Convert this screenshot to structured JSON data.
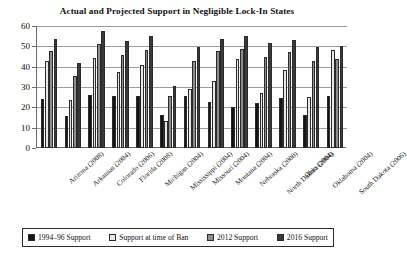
{
  "chart_data": {
    "type": "bar",
    "title": "Actual and Projected Support in Negligible Lock-In States",
    "xlabel": "",
    "ylabel": "",
    "ylim": [
      0,
      60
    ],
    "yticks": [
      0,
      10,
      20,
      30,
      40,
      50,
      60
    ],
    "grid": true,
    "legend_position": "bottom",
    "categories": [
      "Arizona (2008)",
      "Arkansas (2004)",
      "Colorado (2006)",
      "Florida (2008)",
      "Michigan (2004)",
      "Mississippi (2004)",
      "Missouri (2004)",
      "Montana (2004)",
      "Nebraska (2000)",
      "North Dakota (2004)",
      "Ohio (2004)",
      "Oklahoma (2004)",
      "South Dakota (2006)"
    ],
    "series": [
      {
        "name": "1994–96 Support",
        "color": "#141414",
        "values": [
          24,
          15.5,
          26,
          25.5,
          25.5,
          16,
          25.5,
          22.5,
          20,
          22,
          24.5,
          16,
          25.5
        ]
      },
      {
        "name": "Support at time of Ban",
        "color": "#e8e8e8",
        "values": [
          43,
          23.5,
          44.5,
          37.5,
          41,
          13.5,
          29,
          33,
          44,
          27,
          38.5,
          25,
          48
        ]
      },
      {
        "name": "2012 Support",
        "color": "#8d8d8d",
        "values": [
          47.5,
          35.5,
          51,
          45.5,
          48,
          25.5,
          43,
          47.5,
          48.5,
          45,
          47,
          43,
          44
        ]
      },
      {
        "name": "2016 Support",
        "color": "#3a3a3a",
        "values": [
          53.5,
          42,
          57.5,
          52.5,
          55,
          30.5,
          49.5,
          53.5,
          55,
          51.5,
          53,
          49.5,
          50
        ]
      }
    ]
  }
}
